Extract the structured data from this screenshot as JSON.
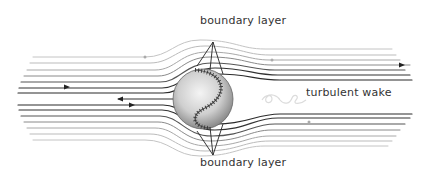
{
  "diagram": {
    "title_partial": "",
    "labels": {
      "boundary_layer_top": "boundary layer",
      "boundary_layer_bottom": "boundary layer",
      "turbulent_wake": "turbulent wake"
    },
    "flow_direction": "left-to-right",
    "colors": {
      "dark_line": "#2b2b2b",
      "mid_line": "#6a6a6a",
      "light_line": "#b5b5b5",
      "wake": "#dcdcdc",
      "text": "#333333"
    }
  }
}
